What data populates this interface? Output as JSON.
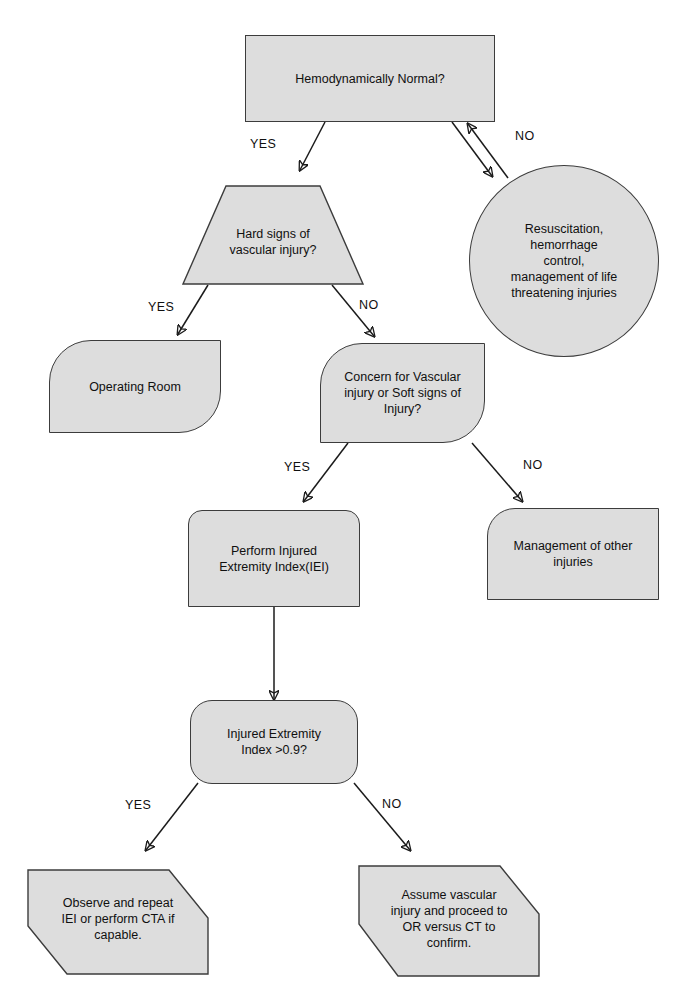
{
  "diagram": {
    "fill_color": "#dddddd",
    "stroke_color": "#3c3c3c",
    "background_color": "#ffffff",
    "text_color": "#101010"
  },
  "nodes": [
    {
      "id": "hemodynamically-normal",
      "label": "Hemodynamically Normal?",
      "shape": "rectangle"
    },
    {
      "id": "hard-signs",
      "label": "Hard signs of\nvascular injury?",
      "shape": "trapezoid"
    },
    {
      "id": "resuscitation",
      "label": "Resuscitation,\nhemorrhage\ncontrol,\nmanagement of life\nthreatening injuries",
      "shape": "ellipse"
    },
    {
      "id": "operating-room",
      "label": "Operating Room",
      "shape": "rounded-tl-br"
    },
    {
      "id": "concern-vascular",
      "label": "Concern for Vascular\ninjury or Soft signs of\nInjury?",
      "shape": "rounded-tl-br"
    },
    {
      "id": "perform-iei",
      "label": "Perform Injured\nExtremity Index(IEI)",
      "shape": "rounded-top"
    },
    {
      "id": "management-other",
      "label": "Management of other\ninjuries",
      "shape": "rounded-tl"
    },
    {
      "id": "iei-threshold",
      "label": "Injured Extremity\nIndex >0.9?",
      "shape": "rounded-rectangle"
    },
    {
      "id": "observe-repeat",
      "label": "Observe and repeat\nIEI or perform CTA if\ncapable.",
      "shape": "hexagon"
    },
    {
      "id": "assume-injury",
      "label": "Assume vascular\ninjury and proceed to\nOR versus CT to\nconfirm.",
      "shape": "hexagon"
    }
  ],
  "edge_labels": [
    {
      "id": "yes-hemodynamic",
      "text": "YES"
    },
    {
      "id": "no-hemodynamic",
      "text": "NO"
    },
    {
      "id": "yes-hard-signs",
      "text": "YES"
    },
    {
      "id": "no-hard-signs",
      "text": "NO"
    },
    {
      "id": "yes-concern",
      "text": "YES"
    },
    {
      "id": "no-concern",
      "text": "NO"
    },
    {
      "id": "yes-iei",
      "text": "YES"
    },
    {
      "id": "no-iei",
      "text": "NO"
    }
  ]
}
